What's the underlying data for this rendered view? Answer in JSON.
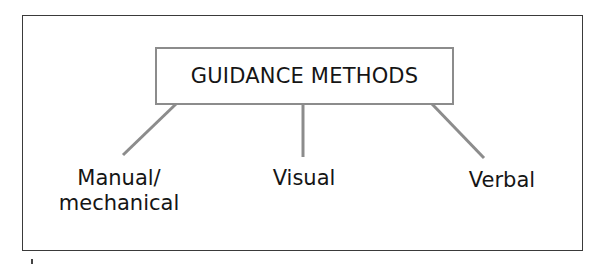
{
  "diagram": {
    "title": "GUIDANCE METHODS",
    "children": [
      {
        "id": "manual",
        "lines": [
          "Manual/",
          "mechanical"
        ]
      },
      {
        "id": "visual",
        "lines": [
          "Visual"
        ]
      },
      {
        "id": "verbal",
        "lines": [
          "Verbal"
        ]
      }
    ],
    "colors": {
      "frame_border": "#3a3a3a",
      "box_border": "#8c8c8c",
      "connector": "#8c8c8c",
      "text": "#151515"
    }
  }
}
